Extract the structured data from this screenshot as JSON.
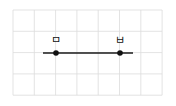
{
  "figure": {
    "type": "grid-line-segment",
    "grid": {
      "x0": 13,
      "y0": 10,
      "cols": 7,
      "rows": 4,
      "cell": 21.3,
      "color": "#dcdcdc"
    },
    "line": {
      "x1": 43,
      "y1": 53,
      "x2": 133,
      "y2": 53,
      "color": "#1a1a1a"
    },
    "points": [
      {
        "label": "ㅁ",
        "x": 56,
        "y": 53
      },
      {
        "label": "ㅂ",
        "x": 120,
        "y": 53
      }
    ],
    "point_color": "#111111"
  }
}
